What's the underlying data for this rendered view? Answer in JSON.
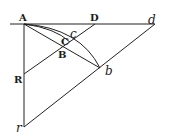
{
  "diagram": {
    "type": "geometric-figure",
    "labels": {
      "A": "A",
      "D": "D",
      "d": "d",
      "C": "C",
      "c": "c",
      "B": "B",
      "b": "b",
      "R": "R",
      "r": "r"
    },
    "points": {
      "A": [
        24,
        24
      ],
      "D": [
        95,
        24
      ],
      "d": [
        152,
        24
      ],
      "c": [
        75,
        40
      ],
      "B": [
        62,
        50
      ],
      "b": [
        100,
        68
      ],
      "R": [
        24,
        74
      ],
      "r": [
        24,
        127
      ]
    },
    "colors": {
      "ink": "#222222",
      "background": "#ffffff"
    }
  }
}
